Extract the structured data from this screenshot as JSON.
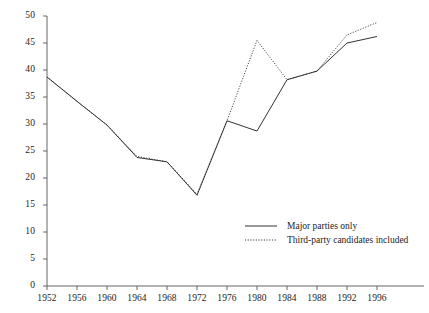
{
  "chart_data": {
    "type": "line",
    "title": "",
    "subtitle": "",
    "xlabel": "",
    "ylabel": "",
    "x": [
      1952,
      1956,
      1960,
      1964,
      1968,
      1972,
      1976,
      1980,
      1984,
      1988,
      1992,
      1996
    ],
    "xlim": [
      1950,
      1998
    ],
    "ylim": [
      0,
      50
    ],
    "y_ticks": [
      0,
      5,
      10,
      15,
      20,
      25,
      30,
      35,
      40,
      45,
      50
    ],
    "x_ticks": [
      1952,
      1956,
      1960,
      1964,
      1968,
      1972,
      1976,
      1980,
      1984,
      1988,
      1992,
      1996
    ],
    "x_tick_labels": [
      "1952",
      "1956",
      "1960",
      "1964",
      "1968",
      "1972",
      "1976",
      "1980",
      "1984",
      "1988",
      "1992",
      "1996"
    ],
    "y_tick_labels": [
      "0",
      "5",
      "10",
      "15",
      "20",
      "25",
      "30",
      "35",
      "40",
      "45",
      "50"
    ],
    "grid": false,
    "legend_position": "inside-bottom-right",
    "series": [
      {
        "name": "Major parties only",
        "style": "solid",
        "color": "#333333",
        "values": [
          38.7,
          34.2,
          29.8,
          23.8,
          23.0,
          16.8,
          30.6,
          28.7,
          38.2,
          39.8,
          45.0,
          46.2
        ]
      },
      {
        "name": "Third-party candidates included",
        "style": "dotted",
        "color": "#333333",
        "values": [
          38.7,
          34.2,
          29.8,
          24.0,
          23.0,
          17.0,
          30.6,
          45.5,
          38.2,
          39.8,
          46.5,
          48.8
        ]
      }
    ]
  },
  "legend": {
    "entries": [
      {
        "label": "Major parties only"
      },
      {
        "label": "Third-party candidates included"
      }
    ]
  }
}
